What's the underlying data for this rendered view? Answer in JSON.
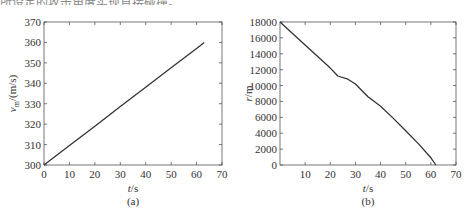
{
  "header_text": "所设定的攻击角度实现直接碰撞。",
  "chart_data": [
    {
      "type": "line",
      "panel": "(a)",
      "title": "",
      "xlabel": "t/s",
      "ylabel": "v_m/(m/s)",
      "xlim": [
        0,
        70
      ],
      "ylim": [
        300,
        370
      ],
      "xticks": [
        0,
        10,
        20,
        30,
        40,
        50,
        60,
        70
      ],
      "yticks": [
        300,
        310,
        320,
        330,
        340,
        350,
        360,
        370
      ],
      "grid": false,
      "series": [
        {
          "name": "v_m",
          "x": [
            0,
            10,
            20,
            30,
            40,
            50,
            60,
            63
          ],
          "y": [
            300,
            309.5,
            319,
            328.6,
            338.1,
            347.6,
            357.1,
            360
          ]
        }
      ]
    },
    {
      "type": "line",
      "panel": "(b)",
      "title": "",
      "xlabel": "t/s",
      "ylabel": "r/m",
      "xlim": [
        0,
        70
      ],
      "ylim": [
        0,
        18000
      ],
      "xticks": [
        10,
        20,
        30,
        40,
        50,
        60,
        70
      ],
      "yticks": [
        0,
        2000,
        4000,
        6000,
        8000,
        10000,
        12000,
        14000,
        16000,
        18000
      ],
      "grid": false,
      "series": [
        {
          "name": "r",
          "x": [
            0,
            10,
            20,
            23,
            27,
            30,
            35,
            37,
            40,
            45,
            50,
            55,
            60,
            62
          ],
          "y": [
            18000,
            15100,
            12200,
            11200,
            10800,
            10200,
            8600,
            8100,
            7400,
            5900,
            4300,
            2700,
            900,
            0
          ]
        }
      ]
    }
  ]
}
